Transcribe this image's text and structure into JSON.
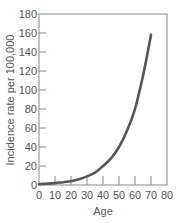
{
  "chart_data": {
    "type": "line",
    "title": "",
    "xlabel": "Age",
    "ylabel": "Incidence rate per 100,000",
    "xlim": [
      0,
      80
    ],
    "ylim": [
      0,
      180
    ],
    "x_ticks": [
      0,
      10,
      20,
      30,
      40,
      50,
      60,
      70,
      80
    ],
    "y_ticks": [
      0,
      20,
      40,
      60,
      80,
      100,
      120,
      140,
      160,
      180
    ],
    "grid": false,
    "legend": null,
    "series": [
      {
        "name": "Incidence rate",
        "color": "#555555",
        "x": [
          0,
          5,
          10,
          15,
          20,
          25,
          30,
          35,
          40,
          45,
          50,
          55,
          60,
          65,
          70
        ],
        "y": [
          1,
          1.5,
          2,
          3,
          4,
          6,
          9,
          13,
          20,
          28,
          40,
          57,
          80,
          115,
          158
        ]
      }
    ]
  }
}
